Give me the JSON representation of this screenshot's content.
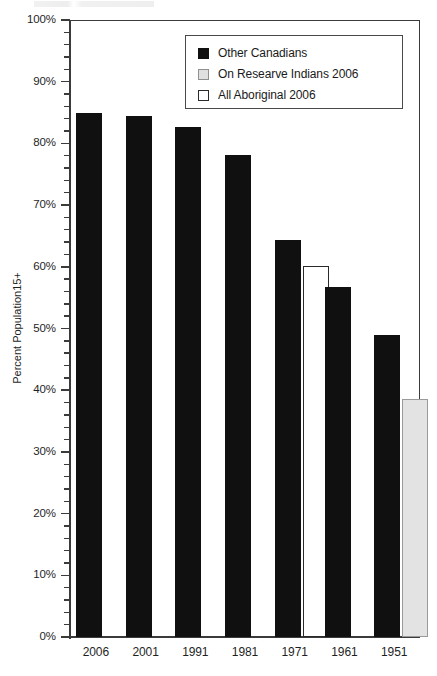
{
  "chart_data": {
    "type": "bar",
    "title": "",
    "subtitle": "",
    "xlabel": "",
    "ylabel": "Percent Population15+",
    "ylim": [
      0,
      100
    ],
    "ytick_labels": [
      "100%",
      "90%",
      "80%",
      "70%",
      "60%",
      "50%",
      "40%",
      "30%",
      "20%",
      "10%",
      "0%"
    ],
    "ytick_values": [
      100,
      90,
      80,
      70,
      60,
      50,
      40,
      30,
      20,
      10,
      0
    ],
    "ytick_minor_step": 2,
    "grid": false,
    "legend_position": "top-center",
    "categories": [
      "2006",
      "2001",
      "1991",
      "1981",
      "1971",
      "1961",
      "1951"
    ],
    "series": [
      {
        "name": "Other Canadians",
        "color": "#101010",
        "swatch": "black",
        "values": [
          85.0,
          84.5,
          82.7,
          78.2,
          64.3,
          56.7,
          49.0
        ]
      },
      {
        "name": "On Researve Indians 2006",
        "color": "#e3e3e3",
        "swatch": "grey",
        "values": [
          null,
          null,
          null,
          null,
          null,
          null,
          38.6
        ]
      },
      {
        "name": "All Aboriginal 2006",
        "color": "#ffffff",
        "swatch": "white",
        "values": [
          null,
          null,
          null,
          null,
          60.2,
          null,
          null
        ]
      }
    ]
  },
  "axis": {
    "y_title": "Percent Population15+",
    "ticks": [
      {
        "label": "100%",
        "value": 100
      },
      {
        "label": "90%",
        "value": 90
      },
      {
        "label": "80%",
        "value": 80
      },
      {
        "label": "70%",
        "value": 70
      },
      {
        "label": "60%",
        "value": 60
      },
      {
        "label": "50%",
        "value": 50
      },
      {
        "label": "40%",
        "value": 40
      },
      {
        "label": "30%",
        "value": 30
      },
      {
        "label": "20%",
        "value": 20
      },
      {
        "label": "10%",
        "value": 10
      },
      {
        "label": "0%",
        "value": 0
      }
    ],
    "x_labels": [
      "2006",
      "2001",
      "1991",
      "1981",
      "1971",
      "1961",
      "1951"
    ]
  },
  "legend": {
    "items": [
      {
        "label": "Other Canadians",
        "swatch": "black"
      },
      {
        "label": "On Researve Indians 2006",
        "swatch": "grey"
      },
      {
        "label": "All Aboriginal 2006",
        "swatch": "white"
      }
    ]
  }
}
